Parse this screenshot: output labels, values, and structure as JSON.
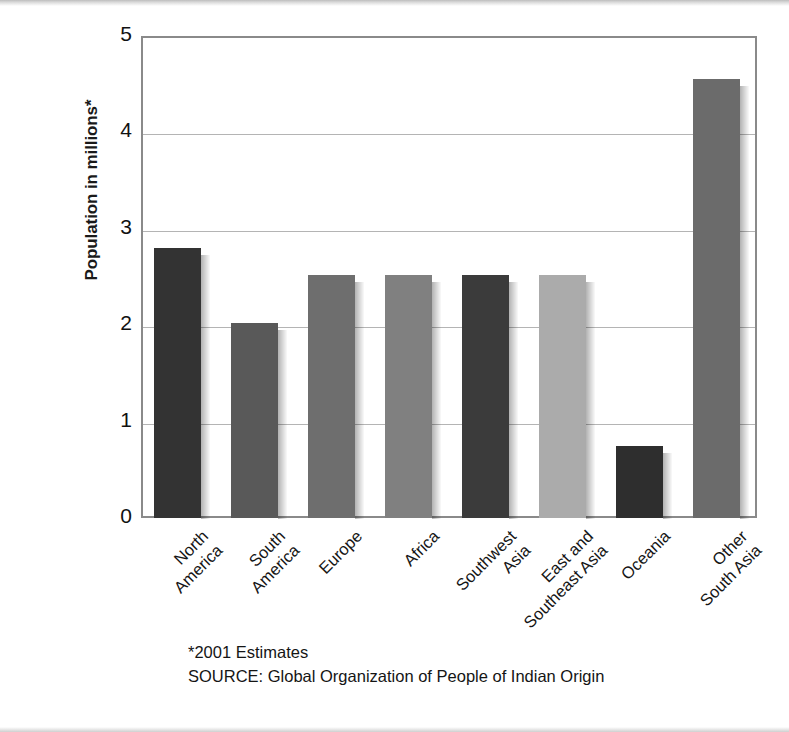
{
  "figure": {
    "y_axis_title": "Population in millions*",
    "y_ticks": [
      "0",
      "1",
      "2",
      "3",
      "4",
      "5"
    ],
    "footnote_estimates": "*2001 Estimates",
    "footnote_source": "SOURCE: Global Organization of People of Indian Origin"
  },
  "chart_data": {
    "type": "bar",
    "title": "",
    "xlabel": "",
    "ylabel": "Population in millions*",
    "ylim": [
      0,
      5
    ],
    "yticks": [
      0,
      1,
      2,
      3,
      4,
      5
    ],
    "grid": true,
    "legend": "none",
    "categories": [
      "North America",
      "South America",
      "Europe",
      "Africa",
      "Southwest Asia",
      "East and Southeast Asia",
      "Oceania",
      "Other South Asia"
    ],
    "category_lines": [
      [
        "North",
        "America"
      ],
      [
        "South",
        "America"
      ],
      [
        "Europe",
        ""
      ],
      [
        "Africa",
        ""
      ],
      [
        "Southwest",
        "Asia"
      ],
      [
        "East and",
        "Southeast Asia"
      ],
      [
        "Oceania",
        ""
      ],
      [
        "Other",
        "South Asia"
      ]
    ],
    "values": [
      2.8,
      2.02,
      2.52,
      2.52,
      2.52,
      2.52,
      0.75,
      4.55
    ],
    "bar_colors": [
      "#333333",
      "#595959",
      "#6e6e6e",
      "#808080",
      "#3b3b3b",
      "#ababab",
      "#2e2e2e",
      "#6b6b6b"
    ],
    "annotations": [
      "*2001 Estimates",
      "SOURCE: Global Organization of People of Indian Origin"
    ]
  }
}
